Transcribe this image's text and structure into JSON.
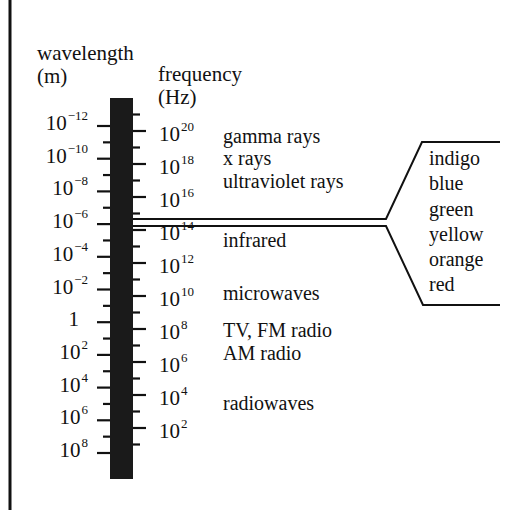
{
  "headers": {
    "wavelength_title": "wavelength",
    "wavelength_unit": "(m)",
    "frequency_title": "frequency",
    "frequency_unit": "(Hz)"
  },
  "wavelength_labels": [
    {
      "base": "10",
      "exp": "−12"
    },
    {
      "base": "10",
      "exp": "−10"
    },
    {
      "base": "10",
      "exp": "−8"
    },
    {
      "base": "10",
      "exp": "−6"
    },
    {
      "base": "10",
      "exp": "−4"
    },
    {
      "base": "10",
      "exp": "−2"
    },
    {
      "base": "1",
      "exp": ""
    },
    {
      "base": "10",
      "exp": "2"
    },
    {
      "base": "10",
      "exp": "4"
    },
    {
      "base": "10",
      "exp": "6"
    },
    {
      "base": "10",
      "exp": "8"
    }
  ],
  "frequency_labels": [
    {
      "base": "10",
      "exp": "20"
    },
    {
      "base": "10",
      "exp": "18"
    },
    {
      "base": "10",
      "exp": "16"
    },
    {
      "base": "10",
      "exp": "14"
    },
    {
      "base": "10",
      "exp": "12"
    },
    {
      "base": "10",
      "exp": "10"
    },
    {
      "base": "10",
      "exp": "8"
    },
    {
      "base": "10",
      "exp": "6"
    },
    {
      "base": "10",
      "exp": "4"
    },
    {
      "base": "10",
      "exp": "2"
    }
  ],
  "bands": [
    "gamma rays",
    "x rays",
    "ultraviolet rays",
    "infrared",
    "microwaves",
    "TV, FM radio",
    "AM radio",
    "radiowaves"
  ],
  "visible_colors": [
    "indigo",
    "blue",
    "green",
    "yellow",
    "orange",
    "red"
  ]
}
